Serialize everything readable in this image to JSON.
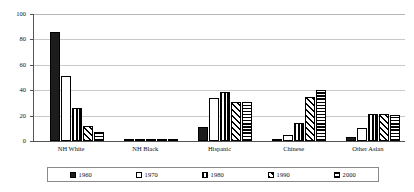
{
  "chart_data": {
    "type": "bar",
    "title": "",
    "xlabel": "",
    "ylabel": "",
    "ylim": [
      0,
      100
    ],
    "yticks": [
      0,
      20,
      40,
      60,
      80,
      100
    ],
    "grid": true,
    "legend_position": "bottom",
    "categories": [
      "NH White",
      "NH Black",
      "Hispanic",
      "Chinese",
      "Other Asian"
    ],
    "series": [
      {
        "name": "1960",
        "pattern": "solid-black",
        "values": [
          86,
          0.5,
          11,
          0,
          3
        ]
      },
      {
        "name": "1970",
        "pattern": "solid-white",
        "values": [
          51,
          1,
          34,
          5,
          10
        ]
      },
      {
        "name": "1980",
        "pattern": "vertical-stripes",
        "values": [
          26,
          1,
          38.5,
          14,
          21.5
        ]
      },
      {
        "name": "1990",
        "pattern": "diagonal-stripes",
        "values": [
          12,
          0.8,
          31,
          35,
          21.5
        ]
      },
      {
        "name": "2000",
        "pattern": "horizontal-stripes",
        "values": [
          7,
          0.7,
          31,
          40,
          20.5
        ]
      }
    ]
  },
  "axis": {
    "y_labels": [
      "100",
      "80",
      "60",
      "40",
      "20",
      "0"
    ]
  },
  "legend": {
    "items": [
      {
        "label": "1960",
        "pattern": "solid-black"
      },
      {
        "label": "1970",
        "pattern": "solid-white"
      },
      {
        "label": "1980",
        "pattern": "vertical-stripes"
      },
      {
        "label": "1990",
        "pattern": "diagonal-stripes"
      },
      {
        "label": "2000",
        "pattern": "horizontal-stripes"
      }
    ]
  }
}
